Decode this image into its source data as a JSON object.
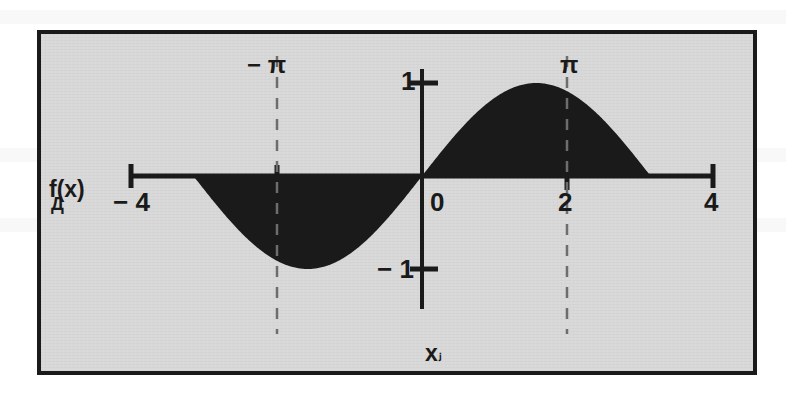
{
  "figure": {
    "background_color": "#d8d8d8",
    "frame_color": "#1a1a1a",
    "ink_color": "#1a1a1a",
    "page_color": "#ffffff"
  },
  "labels": {
    "y_axis_name": "f(x)",
    "y_axis_artifact": "Д",
    "x_axis_name": "x",
    "x_axis_artifact": "ⱼ",
    "x_minus4": "− 4",
    "x_zero": "0",
    "x_two": "2",
    "x_four": "4",
    "y_one": "1",
    "y_minus1": "− 1",
    "pi_left": "− π",
    "pi_right": "π"
  },
  "chart_data": {
    "type": "area",
    "title": "",
    "subtitle": "",
    "xlabel": "x",
    "ylabel": "f(x)",
    "function": "f(x) = sin(x)",
    "xlim": [
      -4,
      4
    ],
    "ylim": [
      -1.35,
      1.35
    ],
    "grid": false,
    "legend": false,
    "fill": "shaded region between curve and x-axis over [-pi, pi]",
    "fill_color": "#1a1a1a",
    "x_ticks": [
      -4,
      -2,
      0,
      2,
      4
    ],
    "x_tick_labels": [
      "− 4",
      "",
      "0",
      "2",
      "4"
    ],
    "y_ticks": [
      -1,
      1
    ],
    "y_tick_labels": [
      "− 1",
      "1"
    ],
    "annotations": [
      {
        "label": "− π",
        "x": -3.14159,
        "style": "vertical-dashed"
      },
      {
        "label": "π",
        "x": 3.14159,
        "style": "vertical-dashed"
      }
    ],
    "x": [
      -4.0,
      -3.8,
      -3.6,
      -3.4,
      -3.2,
      -3.14159,
      -3.0,
      -2.8,
      -2.6,
      -2.4,
      -2.2,
      -2.0,
      -1.8,
      -1.5708,
      -1.4,
      -1.2,
      -1.0,
      -0.8,
      -0.6,
      -0.4,
      -0.2,
      0.0,
      0.2,
      0.4,
      0.6,
      0.8,
      1.0,
      1.2,
      1.4,
      1.5708,
      1.8,
      2.0,
      2.2,
      2.4,
      2.6,
      2.8,
      3.0,
      3.14159,
      3.2,
      3.4,
      3.6,
      3.8,
      4.0
    ],
    "y": [
      0.757,
      0.612,
      0.443,
      0.256,
      0.058,
      0.0,
      -0.141,
      -0.335,
      -0.516,
      -0.675,
      -0.808,
      -0.909,
      -0.974,
      -1.0,
      -0.985,
      -0.932,
      -0.841,
      -0.717,
      -0.565,
      -0.389,
      -0.199,
      0.0,
      0.199,
      0.389,
      0.565,
      0.717,
      0.841,
      0.932,
      0.985,
      1.0,
      0.974,
      0.909,
      0.808,
      0.675,
      0.516,
      0.335,
      0.141,
      0.0,
      -0.058,
      -0.256,
      -0.443,
      -0.612,
      -0.757
    ],
    "series": [
      {
        "name": "sin(x)",
        "values": [
          0.757,
          0.612,
          0.443,
          0.256,
          0.058,
          0.0,
          -0.141,
          -0.335,
          -0.516,
          -0.675,
          -0.808,
          -0.909,
          -0.974,
          -1.0,
          -0.985,
          -0.932,
          -0.841,
          -0.717,
          -0.565,
          -0.389,
          -0.199,
          0.0,
          0.199,
          0.389,
          0.565,
          0.717,
          0.841,
          0.932,
          0.985,
          1.0,
          0.974,
          0.909,
          0.808,
          0.675,
          0.516,
          0.335,
          0.141,
          0.0,
          -0.058,
          -0.256,
          -0.443,
          -0.612,
          -0.757
        ]
      }
    ]
  }
}
